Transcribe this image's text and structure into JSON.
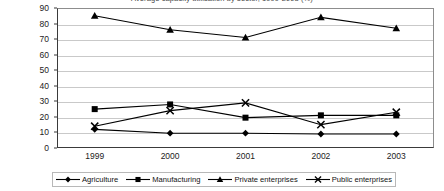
{
  "chart_data": {
    "type": "line",
    "title": "Average capacity utilisation by sector, 1999-2003 (%)",
    "xlabel": "",
    "ylabel": "",
    "categories": [
      "1999",
      "2000",
      "2001",
      "2002",
      "2003"
    ],
    "ylim": [
      0,
      90
    ],
    "ytick_step": 10,
    "yticks": [
      "0",
      "10",
      "20",
      "30",
      "40",
      "50",
      "60",
      "70",
      "80",
      "90"
    ],
    "grid": true,
    "legend_position": "bottom",
    "series": [
      {
        "name": "Agriculture",
        "marker": "diamond",
        "color": "#000000",
        "values": [
          12,
          9.5,
          9.5,
          9,
          9
        ]
      },
      {
        "name": "Manufacturing",
        "marker": "square",
        "color": "#000000",
        "values": [
          25,
          28,
          19.5,
          21,
          21
        ]
      },
      {
        "name": "Private enterprises",
        "marker": "triangle",
        "color": "#000000",
        "values": [
          85,
          76,
          71,
          84,
          77
        ]
      },
      {
        "name": "Public enterprises",
        "marker": "cross",
        "color": "#000000",
        "values": [
          14,
          24,
          29,
          15,
          23
        ]
      }
    ]
  }
}
